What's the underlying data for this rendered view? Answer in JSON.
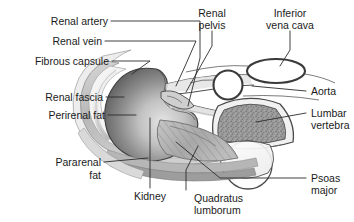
{
  "figure": {
    "type": "anatomical-diagram",
    "background_color": "#ffffff",
    "text_color": "#1a1a1a",
    "leader_color": "#2b2b2b"
  },
  "labels": {
    "renal_artery": "Renal artery",
    "renal_vein": "Renal vein",
    "fibrous_capsule": "Fibrous capsule",
    "renal_fascia": "Renal fascia",
    "perirenal_fat": "Perirenal fat",
    "pararenal_fat_line1": "Pararenal",
    "pararenal_fat_line2": "fat",
    "renal_pelvis_line1": "Renal",
    "renal_pelvis_line2": "pelvis",
    "inferior_vena_cava_line1": "Inferior",
    "inferior_vena_cava_line2": "vena cava",
    "aorta": "Aorta",
    "lumbar_vertebra_line1": "Lumbar",
    "lumbar_vertebra_line2": "vertebra",
    "psoas_major_line1": "Psoas",
    "psoas_major_line2": "major",
    "kidney": "Kidney",
    "quadratus_lumborum_line1": "Quadratus",
    "quadratus_lumborum_line2": "lumborum"
  },
  "structures": {
    "kidney": {
      "name": "Kidney",
      "fill_dark": "#5d5d5d",
      "fill_light": "#dedede",
      "outline": "#3a3a3a"
    },
    "perirenal_fat": {
      "name": "Perirenal fat",
      "fill": "#f2f2f2"
    },
    "renal_fascia": {
      "name": "Renal fascia",
      "fill": "#c9c9c9"
    },
    "pararenal_fat": {
      "name": "Pararenal fat",
      "fill": "#e8e8e8"
    },
    "lumbar_vertebra": {
      "name": "Lumbar vertebra",
      "body_fill": "#9a9a9a",
      "cortex_fill": "#f0f0f0",
      "outline": "#4a4a4a"
    },
    "psoas_major": {
      "name": "Psoas major",
      "fill": "#fbfbfb",
      "outline": "#4a4a4a"
    },
    "quadratus_lumborum": {
      "name": "Quadratus lumborum",
      "fill": "#b4b4b4",
      "striation": "#8a8a8a"
    },
    "inferior_vena_cava": {
      "name": "Inferior vena cava",
      "fill": "#ffffff",
      "outline": "#3a3a3a"
    },
    "aorta": {
      "name": "Aorta",
      "fill": "#ffffff",
      "outline": "#3a3a3a"
    },
    "renal_vessels": {
      "name": "Renal artery and vein",
      "fill": "#e0e0e0",
      "outline": "#4a4a4a"
    }
  }
}
